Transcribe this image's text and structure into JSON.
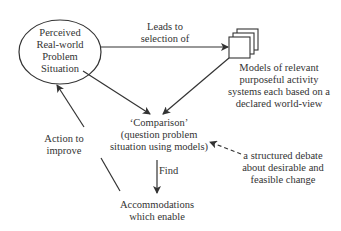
{
  "nodes": {
    "problem_situation": {
      "lines": [
        "Perceived",
        "Real-world",
        "Problem",
        "Situation"
      ]
    },
    "models": {
      "lines": [
        "Models of relevant",
        "purposeful activity",
        "systems each based on a",
        "declared world-view"
      ]
    },
    "comparison": {
      "lines": [
        "‘Comparison’",
        "(question problem",
        "situation using models)"
      ]
    },
    "accommodations": {
      "lines": [
        "Accommodations",
        "which enable"
      ]
    },
    "debate": {
      "lines": [
        "a structured debate",
        "about desirable and",
        "feasible change"
      ]
    }
  },
  "edges": {
    "leads_to": {
      "lines": [
        "Leads to",
        "selection of"
      ]
    },
    "action": {
      "lines": [
        "Action to",
        "improve"
      ]
    },
    "find": {
      "label": "Find"
    }
  },
  "colors": {
    "line": "#333333",
    "text": "#333333",
    "background": "#ffffff"
  }
}
